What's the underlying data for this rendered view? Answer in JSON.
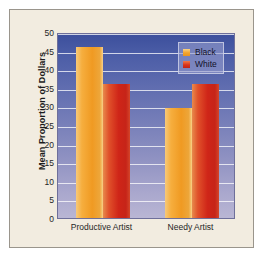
{
  "chart_data": {
    "type": "bar",
    "title": "",
    "xlabel": "",
    "ylabel": "Mean Proportion of Dollars",
    "categories": [
      "Productive Artist",
      "Needy Artist"
    ],
    "series": [
      {
        "name": "Black",
        "color": "#f4a32c",
        "values": [
          46,
          29.5
        ]
      },
      {
        "name": "White",
        "color": "#cf2518",
        "values": [
          36,
          36
        ]
      }
    ],
    "ylim": [
      0,
      50
    ],
    "yticks": [
      0,
      5,
      10,
      15,
      20,
      25,
      30,
      35,
      40,
      45,
      50
    ],
    "ytick_labels": [
      "0",
      "5",
      "10",
      "15",
      "20",
      "25",
      "30",
      "35",
      "40",
      "45",
      "50"
    ],
    "grid": true,
    "grid_axis": "y",
    "legend_position": "top-right",
    "legend_entries": [
      "Black",
      "White"
    ],
    "plot_background": "#6a75b4",
    "figure_background": "#f2ece0"
  }
}
